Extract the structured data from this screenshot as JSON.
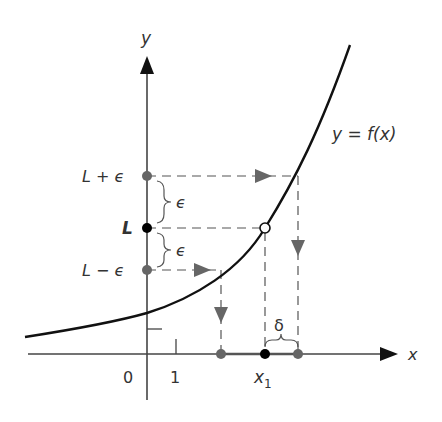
{
  "diagram": {
    "axes": {
      "x_label": "x",
      "y_label": "y",
      "origin_label": "0",
      "tick_x_label": "1"
    },
    "curve_label": "y = f(x)",
    "y_marks": {
      "upper": "L + ϵ",
      "middle": "L",
      "lower": "L − ϵ"
    },
    "epsilon_labels": [
      "ϵ",
      "ϵ"
    ],
    "delta_label": "δ",
    "x1_label": "x",
    "x1_sub": "1",
    "colors": {
      "curve": "#111111",
      "axis": "#444444",
      "gray_marker": "#666666",
      "dashed": "#555555",
      "black_dot": "#000000"
    }
  }
}
